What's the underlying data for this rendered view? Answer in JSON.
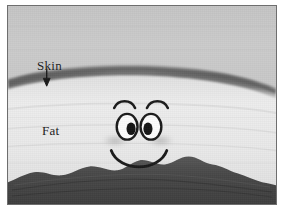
{
  "figure": {
    "kind": "grayscale-ultrasound-illustration",
    "labels": {
      "skin": "Skin",
      "fat": "Fat"
    },
    "annotations": {
      "skin_arrow": "arrow pointing down to skin layer"
    },
    "layers": [
      {
        "name": "upper-tissue",
        "appearance": "uniform medium gray field above the skin band",
        "color": "#c9c9c9"
      },
      {
        "name": "skin-band",
        "appearance": "dark gray arc spanning full width, convex upward, descending at both edges",
        "color": "#6b6b6b"
      },
      {
        "name": "fat-layer",
        "appearance": "light near-white gray field filling the middle",
        "color": "#e9e9e9"
      },
      {
        "name": "muscle-fascia",
        "appearance": "dark irregular wavy band along the bottom",
        "color": "#4a4a4a"
      }
    ],
    "face": {
      "name": "cartoon-smiley-face",
      "parts": [
        {
          "name": "left-eyebrow",
          "shape": "upward arc"
        },
        {
          "name": "right-eyebrow",
          "shape": "upward arc"
        },
        {
          "name": "left-eye",
          "shape": "white oval with black outline and dark pupil"
        },
        {
          "name": "right-eye",
          "shape": "white oval with black outline and dark pupil"
        },
        {
          "name": "left-cheek-shadow",
          "shape": "soft gray smudge"
        },
        {
          "name": "right-cheek-shadow",
          "shape": "soft gray smudge"
        },
        {
          "name": "mouth",
          "shape": "wide U-shaped smile arc"
        }
      ],
      "stroke_color": "#1a1a1a"
    },
    "frame": {
      "border_color": "#6e6e6e",
      "page_background": "#ffffff"
    }
  }
}
